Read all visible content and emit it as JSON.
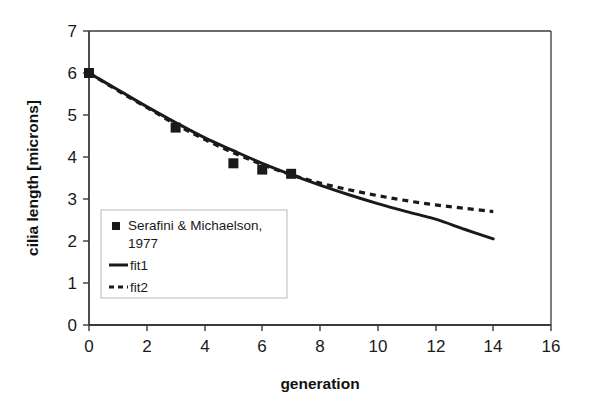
{
  "chart_data": {
    "type": "line",
    "title": "",
    "xlabel": "generation",
    "ylabel": "cilia length [microns]",
    "xlim": [
      0,
      16
    ],
    "ylim": [
      0,
      7
    ],
    "xticks": [
      0,
      2,
      4,
      6,
      8,
      10,
      12,
      14,
      16
    ],
    "yticks": [
      0,
      1,
      2,
      3,
      4,
      5,
      6,
      7
    ],
    "grid": false,
    "legend_position": "center-left",
    "series": [
      {
        "name": "Serafini & Michaelson, 1977",
        "type": "scatter",
        "marker": "square",
        "color": "#1a1a1a",
        "x": [
          0,
          3,
          5,
          6,
          7
        ],
        "values": [
          6.0,
          4.7,
          3.85,
          3.7,
          3.6
        ]
      },
      {
        "name": "fit1",
        "type": "line",
        "style": "solid",
        "color": "#1a1a1a",
        "x": [
          0,
          1,
          2,
          3,
          4,
          5,
          6,
          7,
          8,
          9,
          10,
          11,
          12,
          13,
          14
        ],
        "values": [
          6.0,
          5.6,
          5.2,
          4.82,
          4.46,
          4.15,
          3.85,
          3.58,
          3.33,
          3.1,
          2.89,
          2.7,
          2.52,
          2.28,
          2.05
        ]
      },
      {
        "name": "fit2",
        "type": "line",
        "style": "dashed",
        "color": "#1a1a1a",
        "x": [
          0,
          1,
          2,
          3,
          4,
          5,
          6,
          7,
          8,
          9,
          10,
          11,
          12,
          13,
          14
        ],
        "values": [
          6.0,
          5.58,
          5.18,
          4.78,
          4.42,
          4.1,
          3.82,
          3.58,
          3.38,
          3.22,
          3.08,
          2.96,
          2.86,
          2.78,
          2.7
        ]
      }
    ]
  },
  "axes": {
    "x_label": "generation",
    "y_label": "cilia length [microns]",
    "x_ticks": [
      "0",
      "2",
      "4",
      "6",
      "8",
      "10",
      "12",
      "14",
      "16"
    ],
    "y_ticks": [
      "0",
      "1",
      "2",
      "3",
      "4",
      "5",
      "6",
      "7"
    ]
  },
  "legend": {
    "entries": [
      {
        "label_line1": "Serafini & Michaelson,",
        "label_line2": "1977",
        "symbol": "square-marker"
      },
      {
        "label_line1": "fit1",
        "label_line2": "",
        "symbol": "solid-line"
      },
      {
        "label_line1": "fit2",
        "label_line2": "",
        "symbol": "dashed-line"
      }
    ]
  },
  "colors": {
    "ink": "#1a1a1a",
    "axis": "#3a3a3a",
    "legend_border": "#b9b9b9",
    "background": "#ffffff"
  }
}
